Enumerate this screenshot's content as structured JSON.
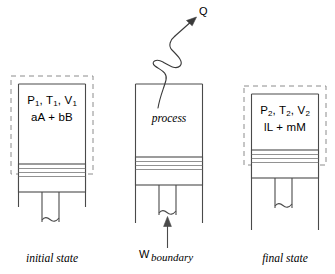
{
  "diagram": {
    "type": "thermodynamics-schematic",
    "colors": {
      "line": "#4a4a4a",
      "dashed_boundary": "#8c8c8c",
      "text": "#000000",
      "background": "#ffffff"
    }
  },
  "panels": [
    {
      "id": "initial",
      "caption": "initial state",
      "state_line1_prefix": "P",
      "state_line1_sub1": "1",
      "state_line1_mid1": ", T",
      "state_line1_sub2": "1",
      "state_line1_mid2": ", V",
      "state_line1_sub3": "1",
      "state_line2": "aA + bB",
      "has_dashed_boundary": true,
      "piston_position": "low"
    },
    {
      "id": "process",
      "caption": "",
      "process_label": "process",
      "has_dashed_boundary": false,
      "piston_position": "mid"
    },
    {
      "id": "final",
      "caption": "final state",
      "state_line1_prefix": "P",
      "state_line1_sub1": "2",
      "state_line1_mid1": ", T",
      "state_line1_sub2": "2",
      "state_line1_mid2": ", V",
      "state_line1_sub3": "2",
      "state_line2": "lL + mM",
      "has_dashed_boundary": true,
      "piston_position": "high"
    }
  ],
  "annotations": {
    "heat_label": "Q",
    "heat_direction": "out-of-system-up-right",
    "work_label": "W",
    "work_subscript": "boundary",
    "work_direction": "into-system-upward"
  }
}
